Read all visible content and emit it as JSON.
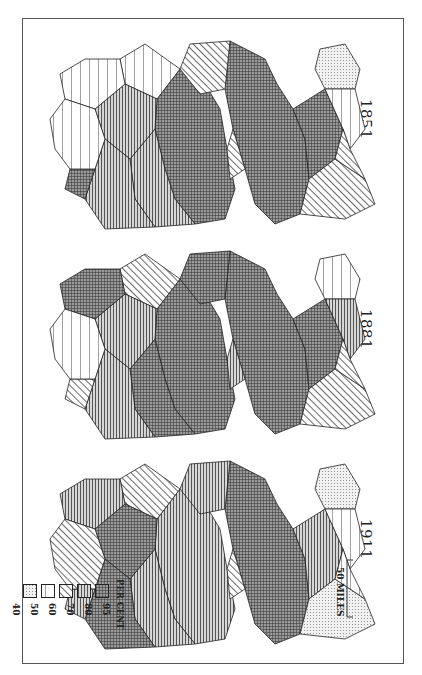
{
  "figure": {
    "maps": [
      {
        "year": "1851"
      },
      {
        "year": "1881"
      },
      {
        "year": "1911"
      }
    ],
    "legend": {
      "title": "PER CENT",
      "classes": [
        {
          "value": "95",
          "pattern": "crosshatch-dense"
        },
        {
          "value": "80",
          "pattern": "horizontal-lines"
        },
        {
          "value": "70",
          "pattern": "diagonal-lines"
        },
        {
          "value": "60",
          "pattern": "vertical-lines"
        },
        {
          "value": "50",
          "pattern": "dots"
        },
        {
          "value": "40",
          "pattern": "light-dots"
        }
      ]
    },
    "scale_bar": {
      "label": "50 MILES"
    },
    "colors": {
      "border": "#555555",
      "ink": "#222222",
      "paper": "#ffffff"
    }
  }
}
